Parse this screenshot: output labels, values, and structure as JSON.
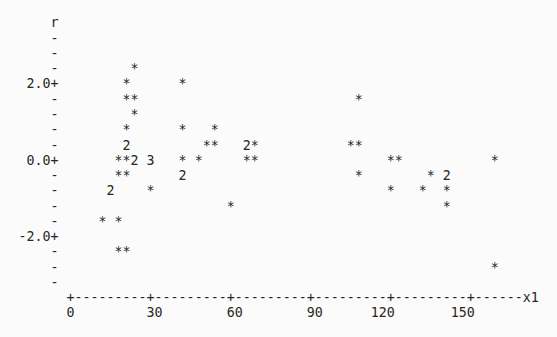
{
  "page": {
    "background_color": "#fbfbfb",
    "text_color": "#262626"
  },
  "chart_data": {
    "type": "scatter",
    "style": "minitab-character-plot",
    "title": "",
    "ylabel": "r",
    "xlabel": "x1",
    "x_ticks": [
      0,
      30,
      60,
      90,
      120,
      150
    ],
    "y_ticks": [
      2.0,
      0.0,
      -2.0
    ],
    "x_per_col": 3,
    "y_per_row": 0.4,
    "xlim": [
      0,
      177
    ],
    "ylim": [
      -3.2,
      3.2
    ],
    "grid": false,
    "legend": "none",
    "symbol_meaning": "* = one observation; a digit marks that many coincident observations",
    "points": [
      {
        "x1": 24,
        "r": 2.4,
        "symbol": "*",
        "n": 1
      },
      {
        "x1": 21,
        "r": 2.0,
        "symbol": "*",
        "n": 1
      },
      {
        "x1": 42,
        "r": 2.0,
        "symbol": "*",
        "n": 1
      },
      {
        "x1": 21,
        "r": 1.6,
        "symbol": "*",
        "n": 1
      },
      {
        "x1": 24,
        "r": 1.6,
        "symbol": "*",
        "n": 1
      },
      {
        "x1": 108,
        "r": 1.6,
        "symbol": "*",
        "n": 1
      },
      {
        "x1": 24,
        "r": 1.2,
        "symbol": "*",
        "n": 1
      },
      {
        "x1": 21,
        "r": 0.8,
        "symbol": "*",
        "n": 1
      },
      {
        "x1": 42,
        "r": 0.8,
        "symbol": "*",
        "n": 1
      },
      {
        "x1": 54,
        "r": 0.8,
        "symbol": "*",
        "n": 1
      },
      {
        "x1": 21,
        "r": 0.4,
        "symbol": "2",
        "n": 2
      },
      {
        "x1": 51,
        "r": 0.4,
        "symbol": "*",
        "n": 1
      },
      {
        "x1": 54,
        "r": 0.4,
        "symbol": "*",
        "n": 1
      },
      {
        "x1": 66,
        "r": 0.4,
        "symbol": "2",
        "n": 2
      },
      {
        "x1": 69,
        "r": 0.4,
        "symbol": "*",
        "n": 1
      },
      {
        "x1": 105,
        "r": 0.4,
        "symbol": "*",
        "n": 1
      },
      {
        "x1": 108,
        "r": 0.4,
        "symbol": "*",
        "n": 1
      },
      {
        "x1": 18,
        "r": 0.0,
        "symbol": "*",
        "n": 1
      },
      {
        "x1": 21,
        "r": 0.0,
        "symbol": "*",
        "n": 1
      },
      {
        "x1": 24,
        "r": 0.0,
        "symbol": "2",
        "n": 2
      },
      {
        "x1": 30,
        "r": 0.0,
        "symbol": "3",
        "n": 3
      },
      {
        "x1": 42,
        "r": 0.0,
        "symbol": "*",
        "n": 1
      },
      {
        "x1": 48,
        "r": 0.0,
        "symbol": "*",
        "n": 1
      },
      {
        "x1": 66,
        "r": 0.0,
        "symbol": "*",
        "n": 1
      },
      {
        "x1": 69,
        "r": 0.0,
        "symbol": "*",
        "n": 1
      },
      {
        "x1": 120,
        "r": 0.0,
        "symbol": "*",
        "n": 1
      },
      {
        "x1": 123,
        "r": 0.0,
        "symbol": "*",
        "n": 1
      },
      {
        "x1": 159,
        "r": 0.0,
        "symbol": "*",
        "n": 1
      },
      {
        "x1": 18,
        "r": -0.4,
        "symbol": "*",
        "n": 1
      },
      {
        "x1": 21,
        "r": -0.4,
        "symbol": "*",
        "n": 1
      },
      {
        "x1": 42,
        "r": -0.4,
        "symbol": "2",
        "n": 2
      },
      {
        "x1": 108,
        "r": -0.4,
        "symbol": "*",
        "n": 1
      },
      {
        "x1": 135,
        "r": -0.4,
        "symbol": "*",
        "n": 1
      },
      {
        "x1": 141,
        "r": -0.4,
        "symbol": "2",
        "n": 2
      },
      {
        "x1": 15,
        "r": -0.8,
        "symbol": "2",
        "n": 2
      },
      {
        "x1": 30,
        "r": -0.8,
        "symbol": "*",
        "n": 1
      },
      {
        "x1": 120,
        "r": -0.8,
        "symbol": "*",
        "n": 1
      },
      {
        "x1": 132,
        "r": -0.8,
        "symbol": "*",
        "n": 1
      },
      {
        "x1": 141,
        "r": -0.8,
        "symbol": "*",
        "n": 1
      },
      {
        "x1": 60,
        "r": -1.2,
        "symbol": "*",
        "n": 1
      },
      {
        "x1": 141,
        "r": -1.2,
        "symbol": "*",
        "n": 1
      },
      {
        "x1": 12,
        "r": -1.6,
        "symbol": "*",
        "n": 1
      },
      {
        "x1": 18,
        "r": -1.6,
        "symbol": "*",
        "n": 1
      },
      {
        "x1": 18,
        "r": -2.4,
        "symbol": "*",
        "n": 1
      },
      {
        "x1": 21,
        "r": -2.4,
        "symbol": "*",
        "n": 1
      },
      {
        "x1": 159,
        "r": -2.8,
        "symbol": "*",
        "n": 1
      }
    ]
  },
  "plot_text": {
    "y_axis_label": "r",
    "y_tick_labels": [
      "2.0+",
      "0.0+",
      "-2.0+"
    ],
    "y_dash": "-",
    "x_axis_row": "+---------+---------+---------+---------+---------+------x1",
    "x_tick_label_row": "0         30        60        90      120       150",
    "x_axis_label": "x1"
  }
}
